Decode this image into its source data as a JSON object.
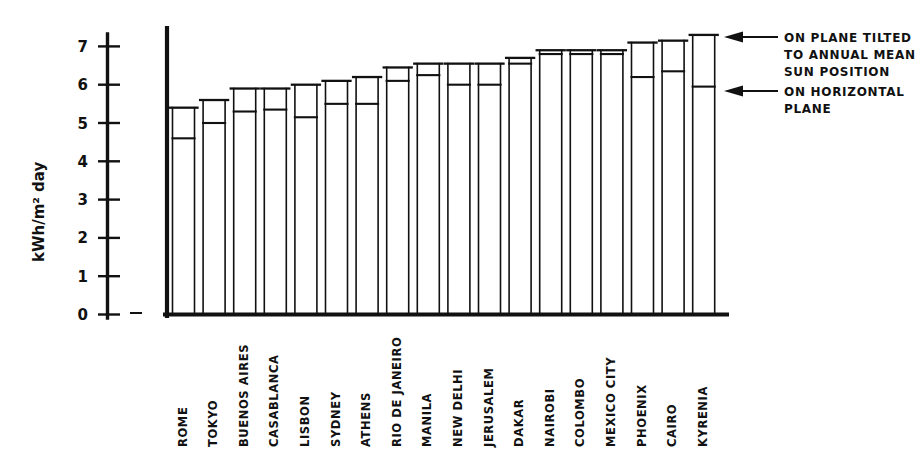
{
  "chart_data": {
    "type": "bar",
    "title": "",
    "subtitle": "",
    "xlabel": "",
    "ylabel": "kWh/m² day",
    "ylim": [
      0,
      7.5
    ],
    "yticks": [
      0,
      1,
      2,
      3,
      4,
      5,
      6,
      7
    ],
    "ytick_labels": [
      "0",
      "1",
      "2",
      "3",
      "4",
      "5",
      "6",
      "7"
    ],
    "grid": false,
    "legend_position": "right-annotations",
    "categories": [
      "ROME",
      "TOKYO",
      "BUENOS AIRES",
      "CASABLANCA",
      "LISBON",
      "SYDNEY",
      "ATHENS",
      "RIO DE JANEIRO",
      "MANILA",
      "NEW DELHI",
      "JERUSALEM",
      "DAKAR",
      "NAIROBI",
      "COLOMBO",
      "MEXICO CITY",
      "PHOENIX",
      "CAIRO",
      "KYRENIA"
    ],
    "series": [
      {
        "name": "ON PLANE TILTED TO ANNUAL MEAN SUN POSITION",
        "values": [
          5.4,
          5.6,
          5.9,
          5.9,
          6.0,
          6.1,
          6.2,
          6.45,
          6.55,
          6.55,
          6.55,
          6.7,
          6.9,
          6.9,
          6.9,
          7.1,
          7.15,
          7.3
        ]
      },
      {
        "name": "ON HORIZONTAL PLANE",
        "values": [
          4.6,
          5.0,
          5.3,
          5.35,
          5.15,
          5.5,
          5.5,
          6.1,
          6.25,
          6.0,
          6.0,
          6.55,
          6.8,
          6.8,
          6.8,
          6.2,
          6.35,
          5.95
        ]
      }
    ],
    "annotations": [
      {
        "id": "tilted-note",
        "text_lines": [
          "ON PLANE TILTED",
          "TO ANNUAL MEAN",
          "SUN POSITION"
        ],
        "points_to_series": 0
      },
      {
        "id": "horizontal-note",
        "text_lines": [
          "ON HORIZONTAL",
          "PLANE"
        ],
        "points_to_series": 1
      }
    ]
  },
  "axis": {
    "y_label": "kWh/m² day",
    "ticks": [
      "7",
      "6",
      "5",
      "4",
      "3",
      "2",
      "1",
      "0"
    ]
  },
  "annotations": {
    "tilted": {
      "line1": "ON PLANE TILTED",
      "line2": "TO ANNUAL MEAN",
      "line3": "SUN POSITION"
    },
    "horizontal": {
      "line1": "ON HORIZONTAL",
      "line2": "PLANE"
    }
  },
  "cities": [
    "ROME",
    "TOKYO",
    "BUENOS AIRES",
    "CASABLANCA",
    "LISBON",
    "SYDNEY",
    "ATHENS",
    "RIO DE JANEIRO",
    "MANILA",
    "NEW DELHI",
    "JERUSALEM",
    "DAKAR",
    "NAIROBI",
    "COLOMBO",
    "MEXICO CITY",
    "PHOENIX",
    "CAIRO",
    "KYRENIA"
  ],
  "colors": {
    "ink": "#111111",
    "background": "#ffffff"
  }
}
